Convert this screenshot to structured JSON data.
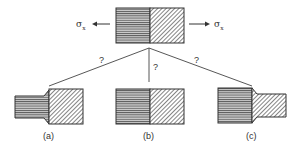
{
  "diagram": {
    "stress_left": "σ",
    "stress_right": "σ",
    "stress_subscript": "x",
    "question_marks": [
      "?",
      "?",
      "?"
    ],
    "captions": [
      "(a)",
      "(b)",
      "(c)"
    ],
    "colors": {
      "line": "#333333",
      "fill_light": "#d8d8d8"
    }
  }
}
